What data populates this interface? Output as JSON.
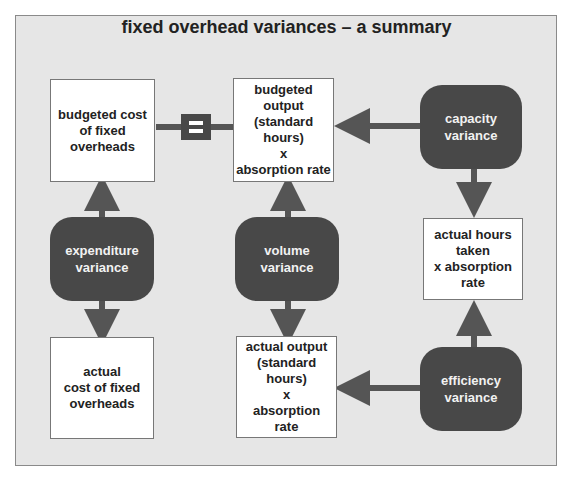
{
  "title": "fixed overhead variances – a summary",
  "boxes": {
    "budgeted_cost": "budgeted cost\nof fixed\noverheads",
    "budgeted_output": "budgeted\noutput\n(standard\nhours)\nx\nabsorption rate",
    "actual_cost": "actual\ncost of fixed\noverheads",
    "actual_output": "actual output\n(standard\nhours)\nx\nabsorption\nrate",
    "actual_hours": "actual hours\ntaken\nx absorption\nrate"
  },
  "variances": {
    "expenditure": "expenditure\nvariance",
    "volume": "volume\nvariance",
    "capacity": "capacity\nvariance",
    "efficiency": "efficiency\nvariance"
  },
  "equals_symbol": "=",
  "colors": {
    "panel": "#e6e6e6",
    "variance_fill": "#484848",
    "arrow": "#555555"
  }
}
